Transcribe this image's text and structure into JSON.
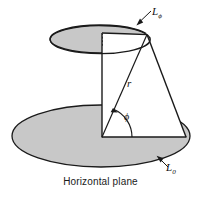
{
  "figure": {
    "caption": "Horizontal plane",
    "labels": {
      "upper_plane": "L",
      "upper_plane_sub": "ϕ",
      "lower_plane": "L",
      "lower_plane_sub": "0",
      "radius": "r",
      "angle": "ϕ"
    },
    "colors": {
      "plane_fill": "#c8c8c8",
      "outline": "#1a1a1a",
      "background": "#ffffff",
      "interior_fill": "#ffffff"
    },
    "geometry": {
      "upper_ellipse": {
        "cx": 100,
        "cy": 39,
        "rx": 50,
        "ry": 14
      },
      "lower_ellipse": {
        "cx": 101,
        "cy": 136,
        "rx": 89,
        "ry": 31
      },
      "axis_top": {
        "x": 102,
        "y": 33
      },
      "axis_bottom": {
        "x": 102,
        "y": 137
      },
      "apex": {
        "x": 147,
        "y": 35
      },
      "base_right": {
        "x": 186,
        "y": 137
      },
      "angle_arc_radius": 30
    }
  }
}
